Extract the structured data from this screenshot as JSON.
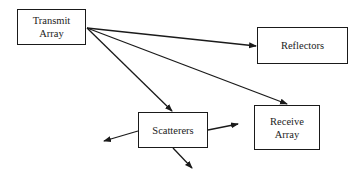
{
  "diagram": {
    "nodes": [
      {
        "id": "transmit",
        "label": "Transmit\nArray",
        "x": 17,
        "y": 9,
        "w": 69,
        "h": 36
      },
      {
        "id": "reflectors",
        "label": "Reflectors",
        "x": 257,
        "y": 27,
        "w": 91,
        "h": 37
      },
      {
        "id": "scatterers",
        "label": "Scatterers",
        "x": 138,
        "y": 112,
        "w": 70,
        "h": 36
      },
      {
        "id": "receive",
        "label": "Receive\nArray",
        "x": 254,
        "y": 105,
        "w": 66,
        "h": 45
      }
    ],
    "edges": [
      {
        "from": "transmit",
        "to": "reflectors",
        "x1": 87,
        "y1": 28,
        "x2": 256,
        "y2": 46
      },
      {
        "from": "transmit",
        "to": "receive",
        "x1": 87,
        "y1": 28,
        "x2": 287,
        "y2": 104
      },
      {
        "from": "transmit",
        "to": "scatterers",
        "x1": 87,
        "y1": 28,
        "x2": 172,
        "y2": 111
      },
      {
        "from": "scatterers",
        "to": "left",
        "x1": 138,
        "y1": 131,
        "x2": 104,
        "y2": 141
      },
      {
        "from": "scatterers",
        "to": "right",
        "x1": 208,
        "y1": 130,
        "x2": 238,
        "y2": 124
      },
      {
        "from": "scatterers",
        "to": "down",
        "x1": 173,
        "y1": 148,
        "x2": 192,
        "y2": 168
      }
    ],
    "stroke_color": "#1a1a1a"
  }
}
